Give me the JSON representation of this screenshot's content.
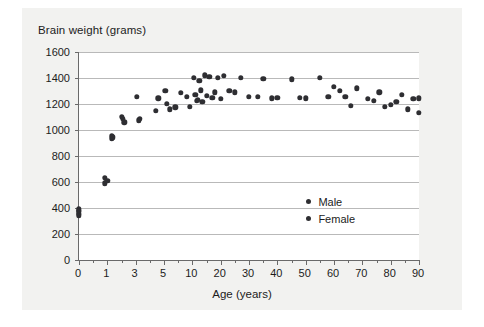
{
  "chart_data": {
    "type": "scatter",
    "title": "Brain weight (grams)",
    "xlabel": "Age (years)",
    "ylabel": "Brain weight (grams)",
    "ylim": [
      0,
      1600
    ],
    "yticks": [
      0,
      200,
      400,
      600,
      800,
      1000,
      1200,
      1400,
      1600
    ],
    "xticks": [
      0,
      1,
      3,
      5,
      10,
      20,
      30,
      40,
      50,
      60,
      70,
      80,
      90
    ],
    "x_scale": "ordinal-compressed",
    "grid": "horizontal",
    "legend_position": "inside-right",
    "legend": [
      "Male",
      "Female"
    ],
    "marker_color": "#2e2e32",
    "series": [
      {
        "name": "Male",
        "points": [
          [
            0,
            390
          ],
          [
            0,
            370
          ],
          [
            0,
            345
          ],
          [
            0.9,
            630
          ],
          [
            0.9,
            590
          ],
          [
            1.3,
            955
          ],
          [
            1.3,
            935
          ],
          [
            2.0,
            1100
          ],
          [
            2.2,
            1060
          ],
          [
            3.1,
            1255
          ],
          [
            3.2,
            1075
          ],
          [
            4.4,
            1150
          ],
          [
            5.2,
            1300
          ],
          [
            6.0,
            1160
          ],
          [
            8.0,
            1285
          ],
          [
            9.0,
            1255
          ],
          [
            10.5,
            1400
          ],
          [
            11.5,
            1225
          ],
          [
            12.5,
            1380
          ],
          [
            13.0,
            1305
          ],
          [
            14.5,
            1420
          ],
          [
            16.0,
            1410
          ],
          [
            17.0,
            1250
          ],
          [
            19.0,
            1400
          ],
          [
            21.0,
            1415
          ],
          [
            23.0,
            1300
          ],
          [
            27.0,
            1400
          ],
          [
            30.0,
            1255
          ],
          [
            35.0,
            1395
          ],
          [
            40.0,
            1250
          ],
          [
            45.0,
            1390
          ],
          [
            50.0,
            1245
          ],
          [
            55.0,
            1400
          ],
          [
            60.0,
            1330
          ],
          [
            64.0,
            1255
          ],
          [
            68.0,
            1320
          ],
          [
            72.0,
            1240
          ],
          [
            76.0,
            1290
          ],
          [
            80.0,
            1195
          ],
          [
            84.0,
            1270
          ],
          [
            88.0,
            1240
          ]
        ]
      },
      {
        "name": "Female",
        "points": [
          [
            0,
            355
          ],
          [
            0,
            380
          ],
          [
            1.0,
            610
          ],
          [
            1.4,
            945
          ],
          [
            2.1,
            1085
          ],
          [
            3.3,
            1085
          ],
          [
            4.6,
            1245
          ],
          [
            5.5,
            1200
          ],
          [
            7.0,
            1175
          ],
          [
            9.5,
            1180
          ],
          [
            11.0,
            1270
          ],
          [
            12.0,
            1230
          ],
          [
            13.5,
            1215
          ],
          [
            15.0,
            1265
          ],
          [
            18.0,
            1290
          ],
          [
            20.0,
            1240
          ],
          [
            25.0,
            1290
          ],
          [
            33.0,
            1255
          ],
          [
            38.0,
            1245
          ],
          [
            48.0,
            1250
          ],
          [
            58.0,
            1255
          ],
          [
            62.0,
            1300
          ],
          [
            66.0,
            1185
          ],
          [
            74.0,
            1225
          ],
          [
            78.0,
            1180
          ],
          [
            82.0,
            1215
          ],
          [
            86.0,
            1160
          ],
          [
            90.0,
            1130
          ],
          [
            90.0,
            1245
          ]
        ]
      }
    ]
  },
  "legend": {
    "male_label": "Male",
    "female_label": "Female"
  }
}
